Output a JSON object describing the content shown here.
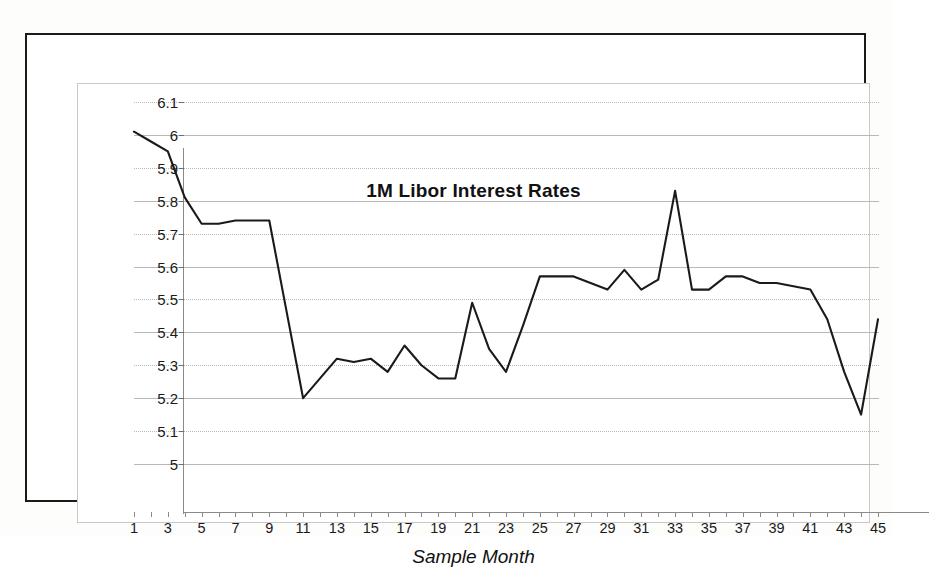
{
  "chart_data": {
    "type": "line",
    "title": "1M Libor Interest Rates",
    "xlabel": "Sample Month",
    "ylabel": "",
    "xlim": [
      1,
      45
    ],
    "ylim": [
      5,
      6.1
    ],
    "grid": true,
    "legend": false,
    "y_ticks": [
      "6.1",
      "6",
      "5.9",
      "5.8",
      "5.7",
      "5.6",
      "5.5",
      "5.4",
      "5.3",
      "5.2",
      "5.1",
      "5"
    ],
    "y_tick_values": [
      6.1,
      6.0,
      5.9,
      5.8,
      5.7,
      5.6,
      5.5,
      5.4,
      5.3,
      5.2,
      5.1,
      5.0
    ],
    "x_ticks": [
      "1",
      "3",
      "5",
      "7",
      "9",
      "11",
      "13",
      "15",
      "17",
      "19",
      "21",
      "23",
      "25",
      "27",
      "29",
      "31",
      "33",
      "35",
      "37",
      "39",
      "41",
      "43",
      "45"
    ],
    "x_tick_values": [
      1,
      3,
      5,
      7,
      9,
      11,
      13,
      15,
      17,
      19,
      21,
      23,
      25,
      27,
      29,
      31,
      33,
      35,
      37,
      39,
      41,
      43,
      45
    ],
    "x": [
      1,
      2,
      3,
      4,
      5,
      6,
      7,
      8,
      9,
      10,
      11,
      12,
      13,
      14,
      15,
      16,
      17,
      18,
      19,
      20,
      21,
      22,
      23,
      24,
      25,
      26,
      27,
      28,
      29,
      30,
      31,
      32,
      33,
      34,
      35,
      36,
      37,
      38,
      39,
      40,
      41,
      42,
      43,
      44,
      45
    ],
    "categories": [
      1,
      2,
      3,
      4,
      5,
      6,
      7,
      8,
      9,
      10,
      11,
      12,
      13,
      14,
      15,
      16,
      17,
      18,
      19,
      20,
      21,
      22,
      23,
      24,
      25,
      26,
      27,
      28,
      29,
      30,
      31,
      32,
      33,
      34,
      35,
      36,
      37,
      38,
      39,
      40,
      41,
      42,
      43,
      44,
      45
    ],
    "values": [
      6.01,
      5.98,
      5.95,
      5.81,
      5.73,
      5.73,
      5.74,
      5.74,
      5.74,
      5.47,
      5.2,
      5.26,
      5.32,
      5.31,
      5.32,
      5.28,
      5.36,
      5.3,
      5.26,
      5.26,
      5.49,
      5.35,
      5.28,
      5.42,
      5.57,
      5.57,
      5.57,
      5.55,
      5.53,
      5.59,
      5.53,
      5.56,
      5.83,
      5.53,
      5.53,
      5.57,
      5.57,
      5.55,
      5.55,
      5.54,
      5.53,
      5.44,
      5.28,
      5.15,
      5.44
    ],
    "series": [
      {
        "name": "1M Libor",
        "color": "#1a1a1a",
        "values": [
          6.01,
          5.98,
          5.95,
          5.81,
          5.73,
          5.73,
          5.74,
          5.74,
          5.74,
          5.47,
          5.2,
          5.26,
          5.32,
          5.31,
          5.32,
          5.28,
          5.36,
          5.3,
          5.26,
          5.26,
          5.49,
          5.35,
          5.28,
          5.42,
          5.57,
          5.57,
          5.57,
          5.55,
          5.53,
          5.59,
          5.53,
          5.56,
          5.83,
          5.53,
          5.53,
          5.57,
          5.57,
          5.55,
          5.55,
          5.54,
          5.53,
          5.44,
          5.28,
          5.15,
          5.44
        ]
      }
    ]
  }
}
